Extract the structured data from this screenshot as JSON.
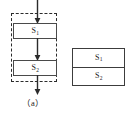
{
  "figure": {
    "panels": [
      {
        "id": "a",
        "caption": "（a）",
        "type": "sequential-flowchart",
        "group_border_style": "dashed",
        "nodes": [
          {
            "label_base": "S",
            "label_sub": "1"
          },
          {
            "label_base": "S",
            "label_sub": "2"
          }
        ],
        "arrows": [
          {
            "name": "entry-arrow",
            "direction": "down"
          },
          {
            "name": "between-arrow",
            "direction": "down"
          },
          {
            "name": "exit-arrow",
            "direction": "down"
          }
        ]
      },
      {
        "id": "b",
        "caption": "（b）",
        "type": "merged-block",
        "group_border_style": "solid",
        "nodes": [
          {
            "label_base": "S",
            "label_sub": "1"
          },
          {
            "label_base": "S",
            "label_sub": "2"
          }
        ]
      }
    ]
  },
  "colors": {
    "background": "#ffffff",
    "stroke": "#3c3c3c",
    "dashed_stroke": "#2b2b2b",
    "text": "#1a1a1a"
  }
}
